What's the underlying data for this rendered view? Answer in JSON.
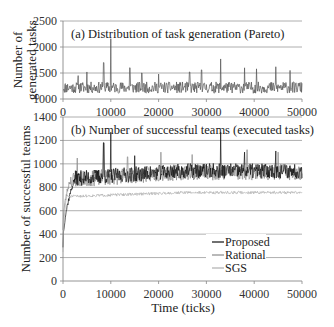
{
  "chart_data": [
    {
      "id": "a",
      "type": "line",
      "title": "(a) Distribution of task generation (Pareto)",
      "xlabel": "",
      "ylabel": [
        "Number of",
        "generated tasks"
      ],
      "xlim": [
        0,
        50000
      ],
      "ylim": [
        1000,
        2500
      ],
      "x_ticks": [
        "0",
        "10000",
        "20000",
        "30000",
        "40000",
        "50000"
      ],
      "y_ticks": [
        "1000",
        "1500",
        "2000",
        "2500"
      ],
      "grid": "horizontal",
      "series": [
        {
          "name": "Generated tasks",
          "color": "#555555",
          "mean": 1220,
          "noise": 110,
          "points": 520,
          "spikes": [
            [
              3200,
              1450
            ],
            [
              5000,
              1520
            ],
            [
              8500,
              1700
            ],
            [
              10000,
              2160
            ],
            [
              14000,
              1600
            ],
            [
              16500,
              1500
            ],
            [
              20000,
              1480
            ],
            [
              26500,
              1520
            ],
            [
              29000,
              1560
            ],
            [
              33000,
              1770
            ],
            [
              38000,
              1600
            ],
            [
              40500,
              1580
            ],
            [
              44500,
              1620
            ],
            [
              47500,
              1550
            ]
          ],
          "seed": 11
        }
      ]
    },
    {
      "id": "b",
      "type": "line",
      "title": "(b) Number of successful teams (executed tasks)",
      "xlabel": "Time (ticks)",
      "ylabel": [
        "Number of successful teams"
      ],
      "xlim": [
        0,
        50000
      ],
      "ylim": [
        0,
        1400
      ],
      "x_ticks": [
        "0",
        "10000",
        "20000",
        "30000",
        "40000",
        "50000"
      ],
      "y_ticks": [
        "0",
        "200",
        "400",
        "600",
        "800",
        "1000",
        "1200",
        "1400"
      ],
      "grid": "horizontal",
      "legend": {
        "position": "lower-right-inside",
        "entries": [
          "Proposed",
          "Rational",
          "SGS"
        ]
      },
      "series": [
        {
          "name": "Rational",
          "color": "#8a8a8a",
          "start": 450,
          "rise_ticks": 1500,
          "plateau_start": 860,
          "plateau_end": 930,
          "noise": 70,
          "points": 520,
          "spikes": [
            [
              3000,
              1050
            ],
            [
              8500,
              1180
            ],
            [
              13500,
              1060
            ],
            [
              20500,
              1100
            ],
            [
              27000,
              1080
            ],
            [
              38500,
              1120
            ],
            [
              45000,
              1100
            ]
          ],
          "seed": 23
        },
        {
          "name": "Proposed",
          "color": "#111111",
          "start": 300,
          "rise_ticks": 2500,
          "plateau_start": 870,
          "plateau_end": 940,
          "noise": 65,
          "points": 520,
          "spikes": [
            [
              8500,
              1180
            ],
            [
              10000,
              1270
            ],
            [
              15000,
              1070
            ],
            [
              33000,
              1270
            ],
            [
              38000,
              1100
            ],
            [
              44500,
              1110
            ]
          ],
          "seed": 37
        },
        {
          "name": "SGS",
          "color": "#b0b0b0",
          "start": 250,
          "rise_ticks": 700,
          "plateau_start": 720,
          "plateau_end": 755,
          "noise": 12,
          "points": 520,
          "spikes": [],
          "seed": 51
        }
      ]
    }
  ],
  "layout": {
    "plot_left_px": 63,
    "plot_right_px": 302,
    "panel_a": {
      "top_px": 21,
      "bottom_px": 99
    },
    "panel_b": {
      "top_px": 117,
      "bottom_px": 281
    }
  },
  "colors": {
    "axis": "#888888",
    "grid": "#9a9a9a",
    "text": "#222222"
  }
}
